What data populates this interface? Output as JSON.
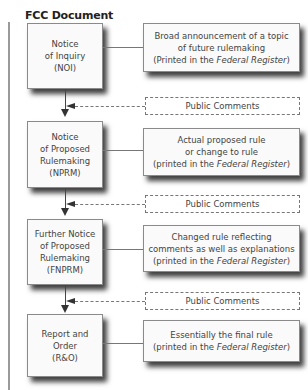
{
  "title": "FCC Document",
  "colors": {
    "background": "#ffffff",
    "box_border": "#8a8a8a",
    "shadow": "#000000",
    "text": "#444444"
  },
  "stages": [
    {
      "document": {
        "line1": "Notice",
        "line2": "of Inquiry",
        "line3": "(NOI)",
        "line4": ""
      },
      "description": {
        "line1": "Broad announcement of a topic",
        "line2": "of future rulemaking",
        "line3_pre": "(Printed in the ",
        "line3_italic": "Federal Register",
        "line3_post": ")"
      }
    },
    {
      "document": {
        "line1": "Notice",
        "line2": "of Proposed",
        "line3": "Rulemaking",
        "line4": "(NPRM)"
      },
      "description": {
        "line1": "Actual proposed rule",
        "line2": "or change to rule",
        "line3_pre": "(printed in the ",
        "line3_italic": "Federal Register",
        "line3_post": ")"
      }
    },
    {
      "document": {
        "line1": "Further Notice",
        "line2": "of Proposed",
        "line3": "Rulemaking",
        "line4": "(FNPRM)"
      },
      "description": {
        "line1": "Changed rule reflecting",
        "line2": "comments as well as explanations",
        "line3_pre": "(printed in the ",
        "line3_italic": "Federal Register",
        "line3_post": ")"
      }
    },
    {
      "document": {
        "line1": "Report and",
        "line2": "Order",
        "line3": "(R&O)",
        "line4": ""
      },
      "description": {
        "line1": "Essentially the final rule",
        "line2": "",
        "line3_pre": "(printed in the ",
        "line3_italic": "Federal Register",
        "line3_post": ")"
      }
    }
  ],
  "comments": [
    {
      "label": "Public Comments"
    },
    {
      "label": "Public Comments"
    },
    {
      "label": "Public Comments"
    }
  ]
}
